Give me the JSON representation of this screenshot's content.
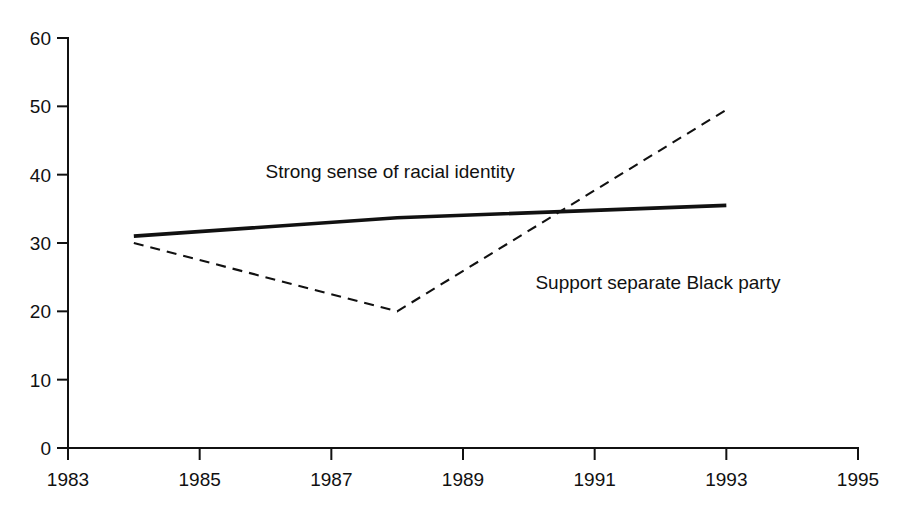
{
  "chart_data": {
    "type": "line",
    "title": "",
    "subtitle": "",
    "xlabel": "",
    "ylabel": "",
    "xlim": [
      1983,
      1995
    ],
    "ylim": [
      0,
      60
    ],
    "grid": false,
    "legend_position": "inline-annotations",
    "x_ticks": [
      "1983",
      "1985",
      "1987",
      "1989",
      "1991",
      "1993",
      "1995"
    ],
    "x_tick_values": [
      1983,
      1985,
      1987,
      1989,
      1991,
      1993,
      1995
    ],
    "y_ticks": [
      "0",
      "10",
      "20",
      "30",
      "40",
      "50",
      "60"
    ],
    "y_tick_values": [
      0,
      10,
      20,
      30,
      40,
      50,
      60
    ],
    "series": [
      {
        "name": "Strong sense of racial identity",
        "style": "solid",
        "color": "#111111",
        "x": [
          1984,
          1988,
          1993
        ],
        "values": [
          31.0,
          33.7,
          35.5
        ],
        "annotation": {
          "text": "Strong sense of racial identity",
          "x": 1986.0,
          "y": 39.5
        }
      },
      {
        "name": "Support separate Black party",
        "style": "dashed",
        "color": "#111111",
        "x": [
          1984,
          1988,
          1993
        ],
        "values": [
          30.0,
          20.0,
          49.5
        ],
        "annotation": {
          "text": "Support separate Black party",
          "x": 1990.1,
          "y": 23.2
        }
      }
    ]
  },
  "axes": {
    "y_axis_name": "value-axis",
    "x_axis_name": "year-axis"
  }
}
